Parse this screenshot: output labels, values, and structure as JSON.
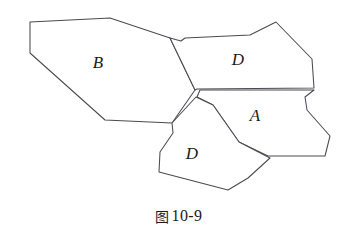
{
  "figure": {
    "caption_cjk": "图",
    "caption_number": "10-9",
    "caption_full": "图 10-9",
    "background_color": "#ffffff",
    "stroke_color": "#4a4a52",
    "label_color": "#1b1b20"
  },
  "regions": [
    {
      "id": "region-b",
      "label": "B",
      "label_x": 98,
      "label_y": 62,
      "points": "30,22 110,18 170,38 195,90 172,123 105,120 30,53"
    },
    {
      "id": "region-d-top",
      "label": "D",
      "label_x": 238,
      "label_y": 59,
      "points": "195,90 170,38 181,41 185,38 250,35 276,22 312,59 314,88 197,89"
    },
    {
      "id": "region-a",
      "label": "A",
      "label_x": 255,
      "label_y": 115,
      "points": "197,97 213,105 239,142 268,156 325,156 330,136 307,110 305,97 314,90 200,90"
    },
    {
      "id": "region-d-bottom",
      "label": "D",
      "label_x": 192,
      "label_y": 153,
      "points": "196,97 213,105 239,142 270,158 248,178 228,190 159,172 160,152 173,133 172,123"
    }
  ]
}
